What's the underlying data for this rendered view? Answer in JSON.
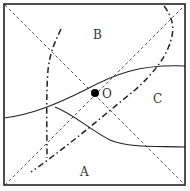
{
  "diagram": {
    "type": "region-partition-diagram",
    "frame": {
      "x": 4,
      "y": 4,
      "width": 181,
      "height": 181,
      "stroke": "#222222"
    },
    "labels": {
      "A": "A",
      "B": "B",
      "C": "C",
      "O": "O"
    },
    "point": {
      "name": "O",
      "cx": 95,
      "cy": 93,
      "r": 4,
      "fill": "#000000"
    },
    "diagonals": [
      {
        "name": "diagonal-top-left-bottom-right",
        "style": "dashed"
      },
      {
        "name": "diagonal-bottom-left-top-right",
        "style": "dashed"
      }
    ],
    "dash_dot_curves": [
      {
        "name": "dash-dot-curve-left",
        "style": "dash-dot"
      },
      {
        "name": "dash-dot-curve-right",
        "style": "dash-dot"
      }
    ],
    "solid_curves": [
      {
        "name": "solid-curve-upper",
        "style": "solid"
      },
      {
        "name": "solid-curve-lower",
        "style": "solid"
      }
    ],
    "colors": {
      "line": "#222222",
      "background": "#ffffff"
    }
  }
}
